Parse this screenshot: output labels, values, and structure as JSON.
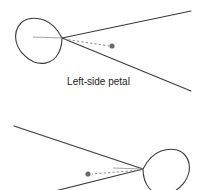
{
  "figure": {
    "background_color": "#ffffff",
    "stroke_color": "#3a3a3a",
    "center_line_color": "#9a9a9a",
    "dashed_line_color": "#8a8a8a",
    "dot_color": "#6b6b6b",
    "text_color": "#1c1c1c"
  },
  "captions": {
    "top": "Left-side petal",
    "bottom": ""
  },
  "panels": [
    {
      "id": "top-panel",
      "name": "left-side-petal-panel",
      "caption": "Left-side petal",
      "apex": {
        "x": 62,
        "y": 38
      },
      "petal": {
        "side": "left",
        "outline_points": "62,38 50,22 36,19 25,22 19,29 18,40 24,53 36,62 49,62 58,53",
        "center_line": {
          "x1": 33,
          "y1": 37,
          "x2": 62,
          "y2": 38
        }
      },
      "rays": [
        {
          "name": "upper-ray",
          "x1": 62,
          "y1": 38,
          "x2": 191,
          "y2": 11
        },
        {
          "name": "lower-ray",
          "x1": 62,
          "y1": 38,
          "x2": 191,
          "y2": 91
        }
      ],
      "dashed_line": {
        "x1": 64,
        "y1": 39,
        "x2": 110,
        "y2": 46
      },
      "dot": {
        "x": 112,
        "y": 46,
        "r": 2.6
      }
    },
    {
      "id": "bottom-panel",
      "name": "right-side-petal-panel",
      "caption": "",
      "apex": {
        "x": 143,
        "y": 169
      },
      "petal": {
        "side": "right",
        "outline_points": "143,169 155,153 169,150 180,153 186,160 187,171 181,184 169,193 156,193 147,184",
        "center_line": {
          "x1": 113,
          "y1": 168,
          "x2": 143,
          "y2": 169
        }
      },
      "rays": [
        {
          "name": "upper-ray",
          "x1": 143,
          "y1": 169,
          "x2": 14,
          "y2": 126
        },
        {
          "name": "lower-ray",
          "x1": 143,
          "y1": 169,
          "x2": 55,
          "y2": 191
        }
      ],
      "dashed_line": {
        "x1": 141,
        "y1": 170,
        "x2": 91,
        "y2": 174
      },
      "dot": {
        "x": 88,
        "y": 174,
        "r": 2.6
      }
    }
  ]
}
